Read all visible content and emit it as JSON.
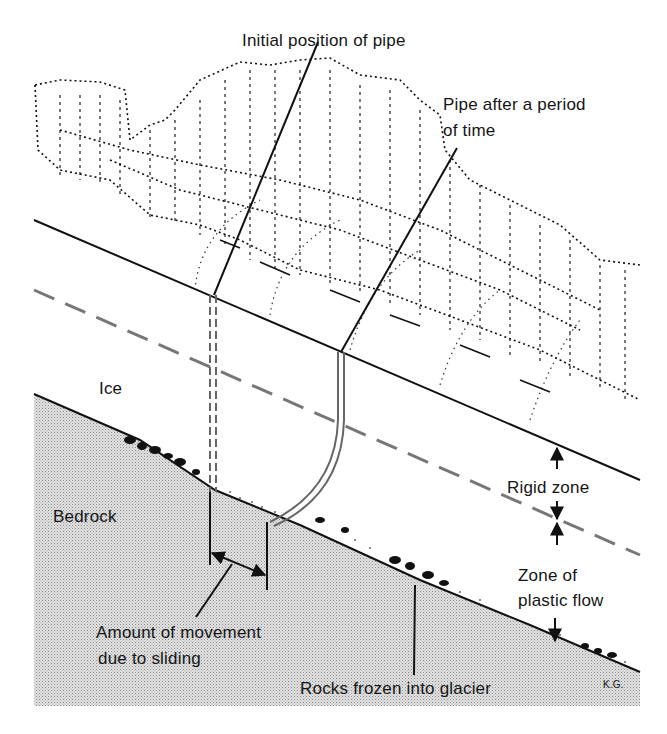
{
  "figure": {
    "labels": {
      "initial_pipe": "Initial position of pipe",
      "pipe_after_line1": "Pipe after a period",
      "pipe_after_line2": "of time",
      "ice": "Ice",
      "bedrock": "Bedrock",
      "rigid_zone": "Rigid zone",
      "plastic_flow_line1": "Zone of",
      "plastic_flow_line2": "plastic flow",
      "sliding_line1": "Amount of movement",
      "sliding_line2": "due to sliding",
      "rocks": "Rocks frozen into glacier",
      "signature": "K.G."
    },
    "colors": {
      "ink": "#111111",
      "bedrock_fill": "#d4d4d4",
      "dashed_boundary": "#777777",
      "pipe": "#666666"
    }
  }
}
